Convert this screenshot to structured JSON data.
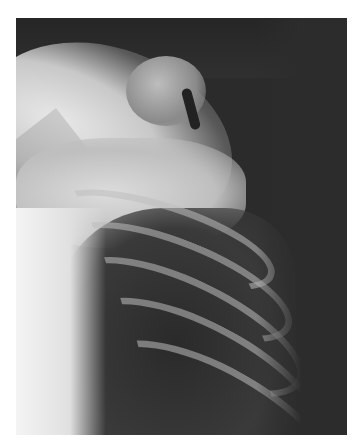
{
  "image": {
    "subject": "shoulder and upper chest radiograph",
    "description": "Grayscale X-ray showing the shoulder joint, humerus, and upper ribs of the left chest"
  }
}
